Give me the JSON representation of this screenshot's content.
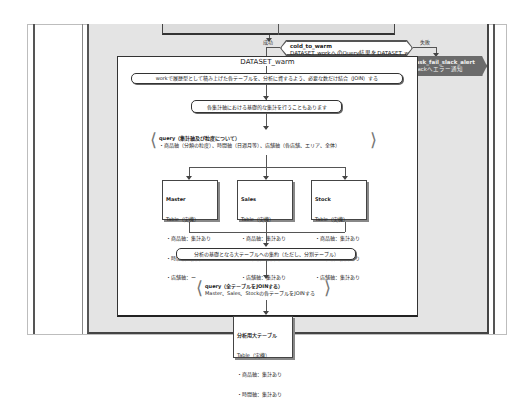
{
  "diagram": {
    "type": "activity-flowchart",
    "top_step": {
      "label": ""
    },
    "branch": {
      "success_label": "成功",
      "failure_label": "失敗",
      "title": "cold_to_warm",
      "description": "DATASET_workへのQuery結果をDATASET_warmへ格納"
    },
    "alert": {
      "title": "task_fail_slack_alert",
      "description": "slackへエラー通知"
    },
    "group": {
      "title": "DATASET_warm",
      "step1": "workで履歴型として積み上げた各テーブルを、分析に資するよう、必要な数だけ結合（JOIN）する",
      "step2": "各集計軸における基礎的な集計を行うこともあります",
      "query1": {
        "title": "query（集計軸及び粒度について）",
        "body": "・商品軸（分類の粒度）、時間軸（日週月等）、店舗軸（各店舗、エリア、全体）"
      },
      "tables": [
        {
          "name": "Master",
          "kind": "Table（実機）",
          "rows": [
            "・商品軸：集計あり",
            "・時間軸：集計なし",
            "・店舗軸：ー"
          ]
        },
        {
          "name": "Sales",
          "kind": "Table（実機）",
          "rows": [
            "・商品軸：集計あり",
            "・時間軸：集計あり",
            "・店舗軸：集計あり"
          ]
        },
        {
          "name": "Stock",
          "kind": "Table（実機）",
          "rows": [
            "・商品軸：集計あり",
            "・時間軸：集計あり",
            "・店舗軸：集計あり"
          ]
        }
      ],
      "step3": "分析の基礎となる大テーブルへの集約（ただし、分割テーブル）",
      "query2": {
        "title": "query（全テーブルをJOINする）",
        "body": "Master、Sales、Stockの各テーブルをJOINする"
      },
      "final_table": {
        "name": "分析用大テーブル",
        "kind": "Table（実機）",
        "rows": [
          "・商品軸：集計あり",
          "・時間軸：集計あり",
          "・店舗軸：集計あり"
        ]
      }
    }
  },
  "colors": {
    "lane_bg": "#e4e4e4",
    "alert_bg": "#6b6b6b",
    "line": "#555555"
  }
}
